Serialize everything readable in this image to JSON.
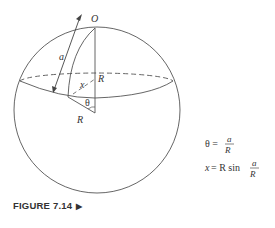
{
  "figure": {
    "caption": "FIGURE 7.14",
    "caption_arrow": "▶",
    "labels": {
      "origin": "O",
      "arc": "a",
      "radius_vertical": "R",
      "radius_bottom": "R",
      "chord": "x",
      "angle": "θ"
    },
    "equations": {
      "eq1_lhs": "θ =",
      "eq1_num": "a",
      "eq1_den": "R",
      "eq2_lhs_var": "x",
      "eq2_lhs_rest": "= R sin",
      "eq2_num": "a",
      "eq2_den": "R"
    }
  }
}
